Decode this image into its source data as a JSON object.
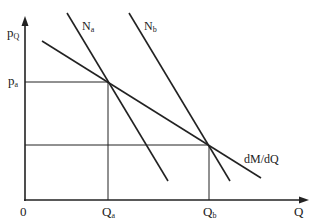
{
  "diagram": {
    "axes": {
      "y_label_main": "p",
      "y_label_sub": "Q",
      "x_label": "Q",
      "origin_label": "0"
    },
    "curves": {
      "Na": {
        "label_main": "N",
        "label_sub": "a"
      },
      "Nb": {
        "label_main": "N",
        "label_sub": "b"
      },
      "mr": {
        "label": "dM/dQ"
      }
    },
    "ticks": {
      "pa": {
        "main": "p",
        "sub": "a"
      },
      "Qa": {
        "main": "Q",
        "sub": "a"
      },
      "Qb": {
        "main": "Q",
        "sub": "b"
      }
    },
    "line_color": "#222222"
  }
}
